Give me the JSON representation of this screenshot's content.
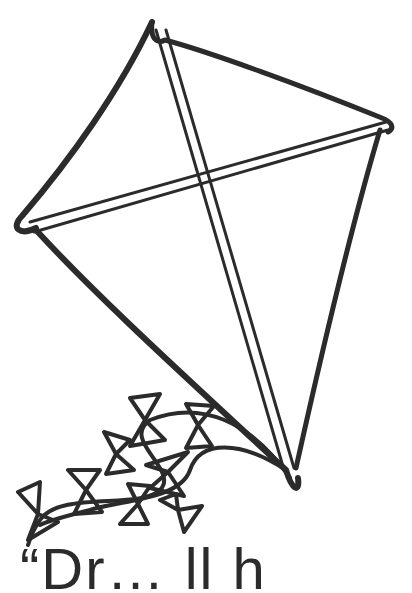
{
  "image": {
    "subject": "kite coloring page",
    "stroke_color": "#2b2b2b",
    "background": "#ffffff"
  },
  "caption": {
    "text": "“Dr… ll h"
  }
}
